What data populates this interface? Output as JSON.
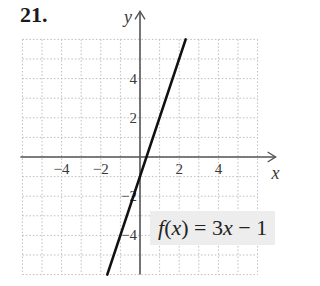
{
  "problem_number": "21.",
  "equation": {
    "func": "f",
    "var": "x",
    "rhs_coef": "3",
    "rhs_var": "x",
    "op": "−",
    "const": "1",
    "text": "f(x) = 3x − 1"
  },
  "colors": {
    "grid": "#bdbdbd",
    "axis": "#555555",
    "line": "#111111",
    "eq_bg": "#ededed"
  },
  "chart_data": {
    "type": "line",
    "title": "f(x) = 3x − 1",
    "xlabel": "x",
    "ylabel": "y",
    "xlim": [
      -6,
      6
    ],
    "ylim": [
      -6,
      6
    ],
    "grid": true,
    "grid_style": "dotted",
    "x_ticks": [
      -4,
      -2,
      2,
      4
    ],
    "y_ticks": [
      4,
      2,
      -2,
      -4
    ],
    "x_tick_labels": [
      "−4",
      "−2",
      "2",
      "4"
    ],
    "y_tick_labels": [
      "4",
      "2",
      "−2",
      "−4"
    ],
    "series": [
      {
        "name": "f(x) = 3x − 1",
        "slope": 3,
        "intercept": -1,
        "x": [
          -1.67,
          2.33
        ],
        "y": [
          -6,
          6
        ]
      }
    ],
    "annotations": [
      {
        "text": "f(x) = 3x − 1",
        "position": "lower-right"
      }
    ]
  }
}
